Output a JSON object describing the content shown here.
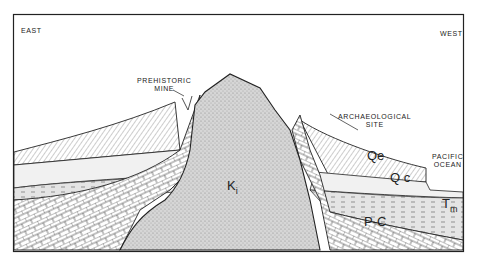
{
  "diagram": {
    "type": "geological cross-section",
    "orientation": {
      "left": "EAST",
      "right": "WEST"
    },
    "annotations": [
      {
        "id": "prehistoric-mine",
        "lines": [
          "PREHISTORIC",
          "MINE"
        ]
      },
      {
        "id": "archaeological-site",
        "lines": [
          "ARCHAEOLOGICAL",
          "SITE"
        ]
      },
      {
        "id": "pacific-ocean",
        "lines": [
          "PACIFIC",
          "OCEAN"
        ]
      }
    ],
    "units": [
      {
        "id": "ki",
        "symbol": "K",
        "subscript": "i"
      },
      {
        "id": "qe",
        "symbol": "Qe"
      },
      {
        "id": "qc",
        "symbol": "Q c"
      },
      {
        "id": "tm",
        "symbol": "T",
        "sub2": "m"
      },
      {
        "id": "pc",
        "symbol": "P-C"
      }
    ],
    "colors": {
      "line": "#222222",
      "stipple": "#bdbdbd",
      "background": "#ffffff"
    }
  }
}
